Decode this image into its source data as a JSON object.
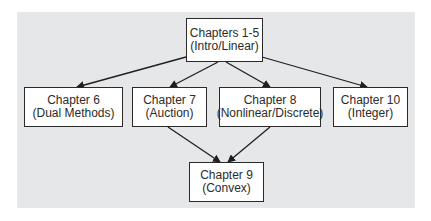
{
  "diagram": {
    "background_color": "#e6e7e9",
    "nodes": {
      "ch1_5": {
        "title": "Chapters 1-5",
        "subtitle": "(Intro/Linear)"
      },
      "ch6": {
        "title": "Chapter 6",
        "subtitle": "(Dual Methods)"
      },
      "ch7": {
        "title": "Chapter 7",
        "subtitle": "(Auction)"
      },
      "ch8": {
        "title": "Chapter 8",
        "subtitle": "(Nonlinear/Discrete)"
      },
      "ch10": {
        "title": "Chapter 10",
        "subtitle": "(Integer)"
      },
      "ch9": {
        "title": "Chapter 9",
        "subtitle": "(Convex)"
      }
    },
    "edges": [
      {
        "from": "ch1_5",
        "to": "ch6"
      },
      {
        "from": "ch1_5",
        "to": "ch7"
      },
      {
        "from": "ch1_5",
        "to": "ch8"
      },
      {
        "from": "ch1_5",
        "to": "ch10"
      },
      {
        "from": "ch7",
        "to": "ch9"
      },
      {
        "from": "ch8",
        "to": "ch9"
      }
    ]
  }
}
